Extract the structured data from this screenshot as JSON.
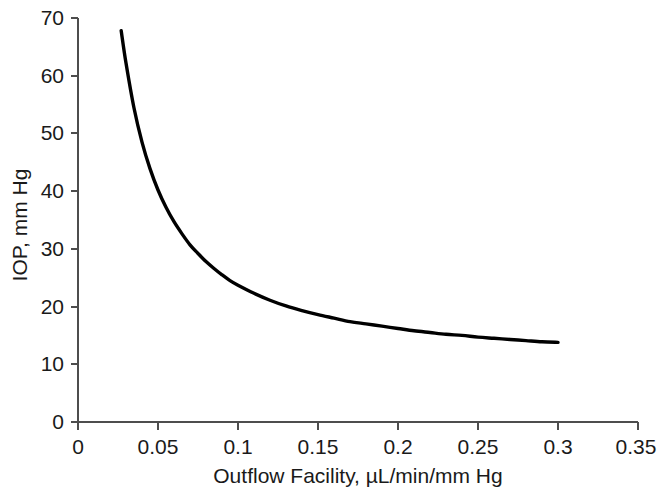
{
  "chart_data": {
    "type": "line",
    "title": "",
    "xlabel": "Outflow Facility, µL/min/mm Hg",
    "ylabel": "IOP, mm Hg",
    "xlim": [
      0,
      0.35
    ],
    "ylim": [
      0,
      70
    ],
    "xticks": [
      "0",
      "0.05",
      "0.1",
      "0.15",
      "0.2",
      "0.25",
      "0.3",
      "0.35"
    ],
    "xtick_values": [
      0,
      0.05,
      0.1,
      0.15,
      0.2,
      0.25,
      0.3,
      0.35
    ],
    "yticks": [
      "0",
      "10",
      "20",
      "30",
      "40",
      "50",
      "60",
      "70"
    ],
    "ytick_values": [
      0,
      10,
      20,
      30,
      40,
      50,
      60,
      70
    ],
    "grid": false,
    "legend": null,
    "series": [
      {
        "name": "IOP vs Outflow Facility",
        "color": "#000000",
        "x": [
          0.027,
          0.03,
          0.035,
          0.04,
          0.045,
          0.05,
          0.055,
          0.06,
          0.065,
          0.07,
          0.075,
          0.08,
          0.085,
          0.09,
          0.095,
          0.1,
          0.11,
          0.12,
          0.13,
          0.14,
          0.15,
          0.16,
          0.17,
          0.18,
          0.19,
          0.2,
          0.21,
          0.22,
          0.23,
          0.24,
          0.25,
          0.26,
          0.27,
          0.28,
          0.29,
          0.3
        ],
        "y": [
          67.8,
          62.2,
          54.4,
          48.5,
          43.9,
          40.2,
          37.2,
          34.7,
          32.6,
          30.7,
          29.2,
          27.8,
          26.6,
          25.5,
          24.5,
          23.7,
          22.3,
          21.1,
          20.1,
          19.3,
          18.6,
          18.0,
          17.4,
          17.0,
          16.6,
          16.2,
          15.8,
          15.5,
          15.2,
          15.0,
          14.7,
          14.5,
          14.3,
          14.1,
          13.9,
          13.8
        ]
      }
    ],
    "model": "IOP = 1.72 / C + 4.5",
    "curve_start": {
      "x": 0.027,
      "y": 67.8
    },
    "curve_end": {
      "x": 0.3,
      "y": 12.5
    }
  }
}
